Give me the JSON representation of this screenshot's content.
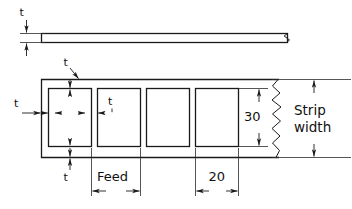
{
  "drawing": {
    "title": "Strip layout for blanking operation",
    "background_color": "#ffffff",
    "line_color": "#1a1a1a"
  },
  "views": {
    "edge_view": {
      "name": "strip-edge-view",
      "description": "Side edge view of flat strip stock",
      "thickness_label": "t"
    },
    "plan_view": {
      "name": "strip-plan-view",
      "description": "Plan view of strip with four rectangular blanks",
      "blank_count": 4
    }
  },
  "dimensions": {
    "thickness": "t",
    "top_margin": "t",
    "left_margin": "t",
    "web": "t",
    "bottom_margin": "t",
    "feed": "Feed",
    "blank_width": "20",
    "blank_height": "30",
    "strip_width_line1": "Strip",
    "strip_width_line2": "width"
  },
  "blanks": [
    {
      "index": 1,
      "name": "blank-1"
    },
    {
      "index": 2,
      "name": "blank-2"
    },
    {
      "index": 3,
      "name": "blank-3"
    },
    {
      "index": 4,
      "name": "blank-4"
    }
  ]
}
